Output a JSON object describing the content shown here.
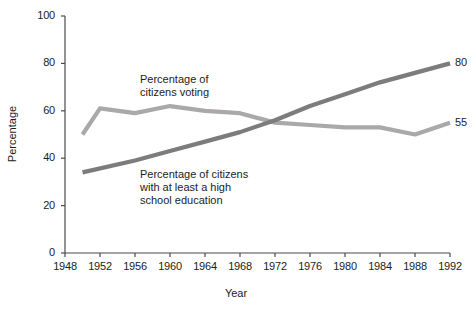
{
  "chart_data": {
    "type": "line",
    "title": "",
    "xlabel": "Year",
    "ylabel": "Percentage",
    "x": [
      1948,
      1952,
      1956,
      1960,
      1964,
      1968,
      1972,
      1976,
      1980,
      1984,
      1988,
      1992
    ],
    "xlim": [
      1948,
      1992
    ],
    "ylim": [
      0,
      100
    ],
    "xticks": [
      "1948",
      "1952",
      "1956",
      "1960",
      "1964",
      "1968",
      "1972",
      "1976",
      "1980",
      "1984",
      "1988",
      "1992"
    ],
    "yticks": [
      "0",
      "20",
      "40",
      "60",
      "80",
      "100"
    ],
    "grid": false,
    "legend_position": "inline-annotations",
    "series": [
      {
        "name": "Percentage of citizens voting",
        "color": "#a9a9a9",
        "end_label": "55",
        "points": [
          {
            "x": 1950,
            "y": 50
          },
          {
            "x": 1952,
            "y": 61
          },
          {
            "x": 1956,
            "y": 59
          },
          {
            "x": 1960,
            "y": 62
          },
          {
            "x": 1964,
            "y": 60
          },
          {
            "x": 1968,
            "y": 59
          },
          {
            "x": 1972,
            "y": 55
          },
          {
            "x": 1976,
            "y": 54
          },
          {
            "x": 1980,
            "y": 53
          },
          {
            "x": 1984,
            "y": 53
          },
          {
            "x": 1988,
            "y": 50
          },
          {
            "x": 1992,
            "y": 55
          }
        ]
      },
      {
        "name": "Percentage of citizens with at least a high school education",
        "color": "#7c7c7c",
        "end_label": "80",
        "points": [
          {
            "x": 1950,
            "y": 34
          },
          {
            "x": 1956,
            "y": 39
          },
          {
            "x": 1960,
            "y": 43
          },
          {
            "x": 1964,
            "y": 47
          },
          {
            "x": 1968,
            "y": 51
          },
          {
            "x": 1972,
            "y": 56
          },
          {
            "x": 1976,
            "y": 62
          },
          {
            "x": 1980,
            "y": 67
          },
          {
            "x": 1984,
            "y": 72
          },
          {
            "x": 1988,
            "y": 76
          },
          {
            "x": 1992,
            "y": 80
          }
        ]
      }
    ],
    "annotations": [
      {
        "id": "voting",
        "text": "Percentage of\ncitizens voting"
      },
      {
        "id": "education",
        "text": "Percentage of citizens\nwith at least a high\nschool education"
      }
    ]
  },
  "colors": {
    "axis": "#4a4a4a",
    "text": "#1c1c1c",
    "voting_line": "#a9a9a9",
    "education_line": "#7c7c7c",
    "background": "#ffffff"
  }
}
